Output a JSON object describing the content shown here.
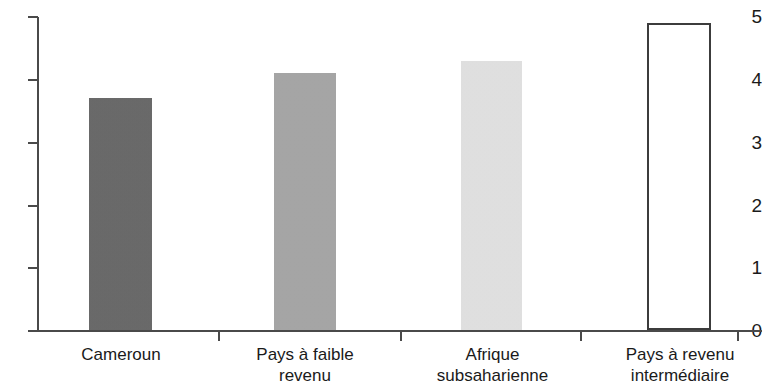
{
  "chart_data": {
    "type": "bar",
    "title": "",
    "subtitle": "",
    "xlabel": "",
    "ylabel": "",
    "categories": [
      "Cameroun",
      "Pays à faible\nrevenu",
      "Afrique\nsubsaharienne",
      "Pays à revenu\nintermédiaire"
    ],
    "values": [
      3.7,
      4.1,
      4.3,
      4.9
    ],
    "ylim": [
      0,
      5
    ],
    "ytick_labels": [
      "0",
      "1",
      "2",
      "3",
      "4",
      "5"
    ],
    "ytick_values": [
      0,
      1,
      2,
      3,
      4,
      5
    ],
    "grid": false,
    "legend": "none",
    "bar_colors": [
      "#666666",
      "#a8a8a8",
      "#e8e8e8",
      "#ffffff"
    ],
    "bar_outline_colors": [
      "none",
      "none",
      "none",
      "#3c3c3c"
    ],
    "axis_color": "#4a4a4a",
    "text_color": "#1a1a1a",
    "background": "#ffffff"
  }
}
